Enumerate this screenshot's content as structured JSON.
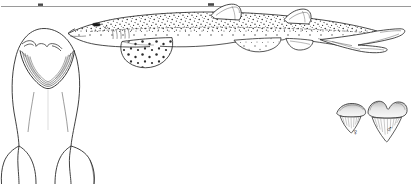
{
  "plate": {
    "title": "Shark identification plate",
    "background_color": "#ffffff",
    "ink_color": "#2b2b2b",
    "width": 412,
    "height": 184
  },
  "rule": {
    "name": "page-rule",
    "color": "#8d8d8d",
    "y": 6
  },
  "figures": [
    {
      "id": "lateral-view",
      "label": "Lateral view of spotted catshark",
      "description": "Whole-body side view, head at left, heterocercal caudal fin at right, body densely covered with dark spots"
    },
    {
      "id": "ventral-head-view",
      "label": "Ventral view of head",
      "description": "Underside of head showing arched mouth, nasal flaps and anterior body outline"
    },
    {
      "id": "tooth-female",
      "label": "Tooth, female",
      "symbol": "♀"
    },
    {
      "id": "tooth-male",
      "label": "Tooth, male",
      "symbol": "♂"
    }
  ],
  "annotations": {
    "female_symbol": "♀",
    "male_symbol": "♂"
  },
  "anatomy": {
    "first_dorsal_fin": "first dorsal fin",
    "second_dorsal_fin": "second dorsal fin",
    "pectoral_fin": "pectoral fin",
    "pelvic_fin": "pelvic fin",
    "anal_fin": "anal fin",
    "caudal_fin": "caudal fin",
    "eye": "eye",
    "snout": "snout",
    "mouth": "mouth",
    "nasal_flap": "nasal flap"
  }
}
